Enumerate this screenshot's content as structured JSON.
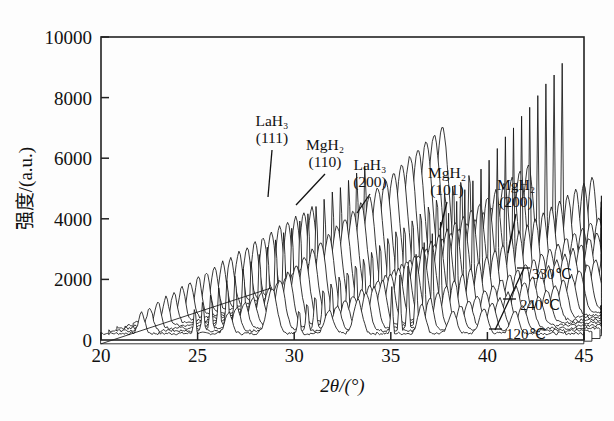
{
  "figure": {
    "name": "xrd-waterfall-plot",
    "background": "#fdfdfd",
    "ink": "#141414"
  },
  "chart_data": {
    "type": "line",
    "title": "",
    "subtitle": "",
    "xlabel": "2θ/(°)",
    "ylabel": "强度/(a.u.)",
    "xlim": [
      20,
      45
    ],
    "ylim": [
      0,
      10000
    ],
    "xticks": [
      20,
      25,
      30,
      35,
      40,
      45
    ],
    "yticks": [
      0,
      2000,
      4000,
      6000,
      8000,
      10000
    ],
    "xtick_labels": [
      "20",
      "25",
      "30",
      "35",
      "40",
      "45"
    ],
    "ytick_labels": [
      "0",
      "2000",
      "4000",
      "6000",
      "8000",
      "10000"
    ],
    "grid": false,
    "legend_position": "right-inside",
    "plot_style": "waterfall-stacked-xrd",
    "n_curves": 22,
    "curve_offset_x_deg": 0.42,
    "curve_offset_y_counts": 88,
    "baseline_counts": 170,
    "series_note": "Each curve is one in-situ XRD scan; bottom curve = 120℃, top curve = 330℃.",
    "temperature_labels": [
      {
        "label": "330℃",
        "curve_index": 21
      },
      {
        "label": "240℃",
        "curve_index": 11
      },
      {
        "label": "120℃",
        "curve_index": 0
      }
    ],
    "peaks": [
      {
        "label_line1": "LaH₃",
        "label_line2": "(111)",
        "two_theta": 28.85,
        "height": 5150,
        "width": 0.36,
        "sharp": false
      },
      {
        "label_line1": "MgH₂",
        "label_line2": "(110)",
        "two_theta": 30.25,
        "height": 3980,
        "width": 0.13,
        "sharp": true
      },
      {
        "label_line1": "LaH₃",
        "label_line2": "(200)",
        "two_theta": 33.3,
        "height": 3880,
        "width": 0.3,
        "sharp": false
      },
      {
        "label_line1": "MgH₂",
        "label_line2": "(101)",
        "two_theta": 36.6,
        "height": 3450,
        "width": 0.26,
        "sharp": false
      },
      {
        "label_line1": "MgH₂",
        "label_line2": "(200)",
        "two_theta": 39.8,
        "height": 2880,
        "width": 0.3,
        "sharp": false
      }
    ],
    "unlabeled_peaks": [
      {
        "two_theta": 24.85,
        "height": 4080,
        "width": 0.12,
        "sharp": true
      },
      {
        "two_theta": 35.05,
        "height": 7230,
        "width": 0.1,
        "sharp": true
      },
      {
        "two_theta": 22.1,
        "height": 2500,
        "width": 0.22,
        "sharp": false
      },
      {
        "two_theta": 26.6,
        "height": 2480,
        "width": 0.26,
        "sharp": false
      },
      {
        "two_theta": 31.8,
        "height": 2620,
        "width": 0.3,
        "sharp": false
      },
      {
        "two_theta": 38.2,
        "height": 2660,
        "width": 0.28,
        "sharp": false
      },
      {
        "two_theta": 41.4,
        "height": 2620,
        "width": 0.3,
        "sharp": false
      }
    ]
  },
  "axis": {
    "x_title": "2θ/(°)",
    "y_title": "强度/(a.u.)"
  }
}
